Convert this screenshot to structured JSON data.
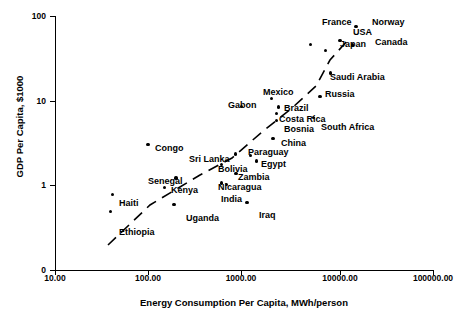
{
  "chart_data": {
    "type": "scatter",
    "title": "",
    "xlabel": "Energy Consumption Per Capita, MWh/person",
    "ylabel": "GDP Per Capita, $1000",
    "xscale": "log",
    "yscale": "log",
    "xlim": [
      10,
      100000
    ],
    "ylim": [
      0.3,
      100
    ],
    "grid": false,
    "legend": "none",
    "xticks": [
      "10.00",
      "100.00",
      "1000.00",
      "10000.00",
      "100000.00"
    ],
    "yticks": [
      "100",
      "10",
      "1",
      "0"
    ],
    "trendline": {
      "style": "dashed",
      "note": "rising dashed fit line across data"
    },
    "points": [
      {
        "label": "Norway",
        "x": 17000,
        "y": 75.0,
        "lx": 372,
        "ly": 18
      },
      {
        "label": "France",
        "x": 5500,
        "y": 46.0,
        "lx": 322,
        "ly": 18
      },
      {
        "label": "USA",
        "x": 11500,
        "y": 51.0,
        "lx": 353,
        "ly": 28
      },
      {
        "label": "Canada",
        "x": 15500,
        "y": 45.0,
        "lx": 375,
        "ly": 38
      },
      {
        "label": "Japan",
        "x": 8000,
        "y": 39.0,
        "lx": 340,
        "ly": 40
      },
      {
        "label": "Saudi Arabia",
        "x": 9000,
        "y": 21.0,
        "lx": 330,
        "ly": 73
      },
      {
        "label": "Russia",
        "x": 7000,
        "y": 11.0,
        "lx": 325,
        "ly": 90
      },
      {
        "label": "Mexico",
        "x": 2100,
        "y": 10.5,
        "lx": 263,
        "ly": 88
      },
      {
        "label": "Gabon",
        "x": 1000,
        "y": 8.5,
        "lx": 228,
        "ly": 101
      },
      {
        "label": "Brazil",
        "x": 2500,
        "y": 8.3,
        "lx": 284,
        "ly": 104
      },
      {
        "label": "Costa Rica",
        "x": 2400,
        "y": 7.0,
        "lx": 279,
        "ly": 115
      },
      {
        "label": "Bosnia",
        "x": 2400,
        "y": 5.7,
        "lx": 284,
        "ly": 125
      },
      {
        "label": "South Africa",
        "x": 6000,
        "y": 6.2,
        "lx": 321,
        "ly": 123
      },
      {
        "label": "China",
        "x": 2200,
        "y": 3.5,
        "lx": 281,
        "ly": 139
      },
      {
        "label": "Congo",
        "x": 100,
        "y": 3.0,
        "lx": 155,
        "ly": 144
      },
      {
        "label": "Sri Lanka",
        "x": 870,
        "y": 2.3,
        "lx": 189,
        "ly": 155
      },
      {
        "label": "Paraguay",
        "x": 1250,
        "y": 2.2,
        "lx": 248,
        "ly": 148
      },
      {
        "label": "Bolivia",
        "x": 620,
        "y": 1.75,
        "lx": 218,
        "ly": 165
      },
      {
        "label": "Egypt",
        "x": 1450,
        "y": 1.9,
        "lx": 261,
        "ly": 160
      },
      {
        "label": "Zambia",
        "x": 880,
        "y": 1.35,
        "lx": 238,
        "ly": 173
      },
      {
        "label": "Senegal",
        "x": 200,
        "y": 1.2,
        "lx": 148,
        "ly": 177
      },
      {
        "label": "Nicaragua",
        "x": 620,
        "y": 1.05,
        "lx": 218,
        "ly": 183
      },
      {
        "label": "India",
        "x": 700,
        "y": 1.0,
        "lx": 221,
        "ly": 195
      },
      {
        "label": "Kenya",
        "x": 150,
        "y": 0.93,
        "lx": 171,
        "ly": 186
      },
      {
        "label": "Haiti",
        "x": 42,
        "y": 0.76,
        "lx": 119,
        "ly": 199
      },
      {
        "label": "Uganda",
        "x": 190,
        "y": 0.58,
        "lx": 186,
        "ly": 214
      },
      {
        "label": "Iraq",
        "x": 1150,
        "y": 0.62,
        "lx": 259,
        "ly": 211
      },
      {
        "label": "Ethiopia",
        "x": 40,
        "y": 0.48,
        "lx": 119,
        "ly": 228
      }
    ]
  }
}
